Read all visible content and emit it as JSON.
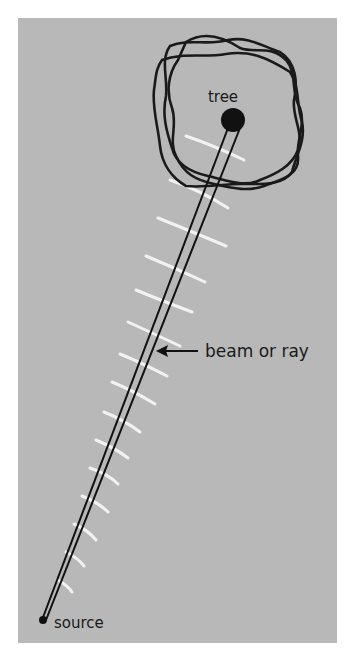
{
  "figure": {
    "labels": {
      "tree": "tree",
      "beam": "beam or ray",
      "source": "source"
    },
    "colors": {
      "background": "#ffffff",
      "panel": "#b8b8b8",
      "ink": "#1a1a1a",
      "wavefront": "#f2f2f2"
    }
  }
}
